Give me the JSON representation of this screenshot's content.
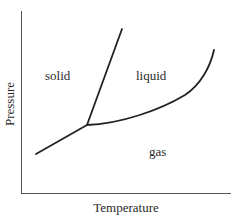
{
  "diagram": {
    "type": "phase-diagram",
    "axes": {
      "x_label": "Temperature",
      "y_label": "Pressure"
    },
    "regions": {
      "solid": "solid",
      "liquid": "liquid",
      "gas": "gas"
    },
    "boundaries": [
      {
        "name": "sublimation-curve",
        "from": "lower-left",
        "to": "triple-point"
      },
      {
        "name": "melting-curve",
        "from": "triple-point",
        "to": "upper"
      },
      {
        "name": "vaporization-curve",
        "from": "triple-point",
        "to": "upper-right"
      }
    ],
    "colors": {
      "line": "#222222",
      "axis": "#555555",
      "background": "#ffffff"
    }
  }
}
